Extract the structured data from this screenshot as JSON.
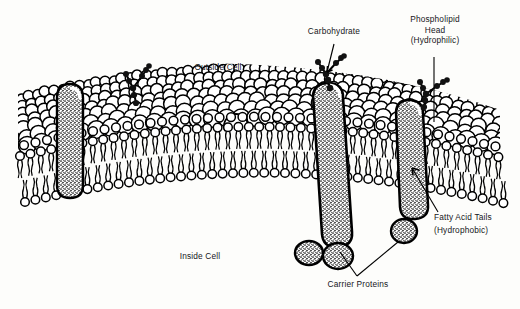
{
  "diagram": {
    "background_color": "#fdfdfb",
    "ink_color": "#000000",
    "text_color": "#16161a"
  },
  "labels": {
    "outside_cell": "Outside Cell",
    "inside_cell": "Inside Cell",
    "carbohydrate": "Carbohydrate",
    "phospholipid_head_l1": "Phospholipid",
    "phospholipid_head_l2": "Head",
    "phospholipid_head_l3": "(Hydrophilic)",
    "fatty_acid_tails_l1": "Fatty Acid Tails",
    "fatty_acid_tails_l2": "(Hydrophobic)",
    "carrier_proteins": "Carrier Proteins"
  },
  "structures": {
    "bilayer": "phospholipid bilayer with spherical hydrophilic heads and wavy hydrophobic tails",
    "proteins": [
      {
        "name": "left-carrier-protein",
        "style": "stippled transmembrane column"
      },
      {
        "name": "center-carrier-protein",
        "style": "stippled transmembrane column with glycoprotein"
      },
      {
        "name": "right-carrier-protein",
        "style": "stippled transmembrane column with basal lobe"
      }
    ],
    "carbohydrate_chains": [
      "left glycolipid",
      "center glycoprotein",
      "right glycoprotein"
    ],
    "surface_pore": "large vesicle/pore opening on outer surface"
  }
}
